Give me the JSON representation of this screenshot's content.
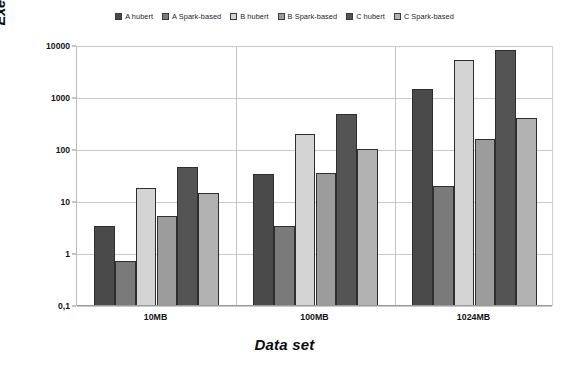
{
  "chart_data": {
    "type": "bar",
    "title": "",
    "xlabel": "Data set",
    "ylabel": "Execution time - log scale (s)",
    "categories": [
      "10MB",
      "100MB",
      "1024MB"
    ],
    "yscale": "log",
    "ylim": [
      0.1,
      10000
    ],
    "ytick_labels": [
      "10000",
      "1000",
      "100",
      "10",
      "1",
      "0,1"
    ],
    "ytick_values": [
      10000,
      1000,
      100,
      10,
      1,
      0.1
    ],
    "grid": true,
    "legend_position": "top-center",
    "series": [
      {
        "name": "A hubert",
        "color": "#4a4a4a",
        "values": [
          3.5,
          34,
          1500
        ]
      },
      {
        "name": "A Spark-based",
        "color": "#7a7a7a",
        "values": [
          0.75,
          3.4,
          20
        ]
      },
      {
        "name": "B hubert",
        "color": "#d4d4d4",
        "values": [
          19,
          200,
          5500
        ]
      },
      {
        "name": "B Spark-based",
        "color": "#9c9c9c",
        "values": [
          5.5,
          36,
          160
        ]
      },
      {
        "name": "C hubert",
        "color": "#545454",
        "values": [
          47,
          500,
          8500
        ]
      },
      {
        "name": "C Spark-based",
        "color": "#b2b2b2",
        "values": [
          15,
          105,
          420
        ]
      }
    ]
  }
}
